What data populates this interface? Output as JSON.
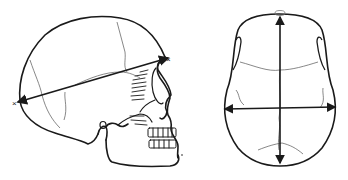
{
  "figure": {
    "panels": [
      {
        "id": "lateral",
        "label": "Skull, lateral view",
        "measurement": "glabella–opisthocranion length (maximum cranial length)"
      },
      {
        "id": "superior",
        "label": "Skull, superior view",
        "measurement": "maximum cranial length and breadth"
      }
    ],
    "colors": {
      "ink": "#1a1a1a",
      "suture": "#555555",
      "background": "#ffffff"
    },
    "markers": {
      "endpoint_symbol": "×"
    }
  }
}
